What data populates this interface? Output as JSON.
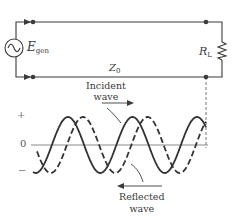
{
  "diagram": {
    "colors": {
      "ink": "#3a3a3a",
      "axis": "#8a8a8a",
      "background": "#ffffff"
    },
    "circuit": {
      "source_label_main": "E",
      "source_label_sub": "gen",
      "line_label_main": "Z",
      "line_label_sub": "0",
      "load_label_main": "R",
      "load_label_sub": "L"
    },
    "waves": {
      "axis_plus": "+",
      "axis_zero": "0",
      "axis_minus": "−",
      "incident_label_line1": "Incident",
      "incident_label_line2": "wave",
      "reflected_label_line1": "Reflected",
      "reflected_label_line2": "wave",
      "axis_y": 145,
      "amplitude": 28,
      "period": 64.5,
      "x_start": 33,
      "x_end": 206,
      "incident_peak_x": 68,
      "reflected_peak_x": 83
    }
  }
}
